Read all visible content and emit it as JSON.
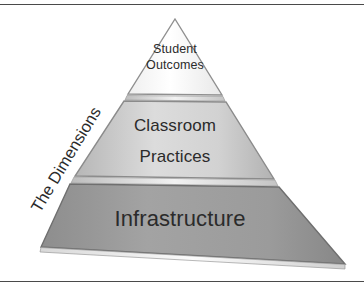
{
  "figure": {
    "side_label": "The Dimensions",
    "background_color": "#ffffff",
    "frame_rule_color": "#4a4a4a",
    "text_color": "#2b2b2b"
  },
  "pyramid": {
    "apex": {
      "x": 175,
      "y": 19
    },
    "base_left": {
      "x": 40,
      "y": 250
    },
    "base_right": {
      "x": 345,
      "y": 268
    },
    "tiers": [
      {
        "id": "student-outcomes",
        "label": "Student\nOutcomes",
        "level": 1,
        "position": "top",
        "fill_color": "#fdfdfd",
        "fill_color_edge": "#eeeeee",
        "outline_color": "#8b8b8b"
      },
      {
        "id": "classroom-practices",
        "label": "Classroom\nPractices",
        "level": 2,
        "position": "middle",
        "fill_color": "#d6d6d6",
        "fill_color_edge": "#b9b9b9",
        "outline_color": "#8b8b8b"
      },
      {
        "id": "infrastructure",
        "label": "Infrastructure",
        "level": 3,
        "position": "base",
        "fill_color": "#9d9d9d",
        "fill_color_edge": "#8a8a8a",
        "outline_color": "#6f6f6f"
      }
    ],
    "dividers": [
      {
        "id": "divider-top",
        "between": "student-outcomes / classroom-practices",
        "color": "#cfcfcf"
      },
      {
        "id": "divider-bottom",
        "between": "classroom-practices / infrastructure",
        "color": "#cfcfcf"
      }
    ]
  }
}
